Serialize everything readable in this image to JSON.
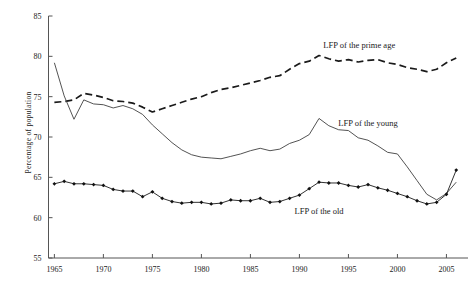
{
  "chart_data": {
    "type": "line",
    "title": "",
    "xlabel": "",
    "ylabel": "Percentage of population",
    "xlim": [
      1964.4,
      2007.2
    ],
    "ylim": [
      55,
      85
    ],
    "grid": false,
    "legend_position": "inline-annotations",
    "x_ticks": [
      "1965",
      "1970",
      "1975",
      "1980",
      "1985",
      "1990",
      "1995",
      "2000",
      "2005"
    ],
    "x_tick_values": [
      1965,
      1970,
      1975,
      1980,
      1985,
      1990,
      1995,
      2000,
      2005
    ],
    "y_ticks": [
      "55",
      "60",
      "65",
      "70",
      "75",
      "80",
      "85"
    ],
    "y_tick_values": [
      55,
      60,
      65,
      70,
      75,
      80,
      85
    ],
    "x": [
      1965,
      1966,
      1967,
      1968,
      1969,
      1970,
      1971,
      1972,
      1973,
      1974,
      1975,
      1976,
      1977,
      1978,
      1979,
      1980,
      1981,
      1982,
      1983,
      1984,
      1985,
      1986,
      1987,
      1988,
      1989,
      1990,
      1991,
      1992,
      1993,
      1994,
      1995,
      1996,
      1997,
      1998,
      1999,
      2000,
      2001,
      2002,
      2003,
      2004,
      2005,
      2006
    ],
    "series": [
      {
        "name": "LFP of the prime age",
        "style": "dashed",
        "marker": "none",
        "color": "#1a1a1a",
        "label": "LFP of the prime age",
        "values": [
          74.3,
          74.4,
          74.6,
          75.4,
          75.2,
          74.9,
          74.5,
          74.4,
          74.2,
          73.7,
          73.1,
          73.5,
          73.9,
          74.3,
          74.7,
          75.0,
          75.5,
          75.9,
          76.1,
          76.4,
          76.7,
          77.0,
          77.4,
          77.6,
          78.4,
          79.1,
          79.4,
          80.1,
          79.7,
          79.4,
          79.6,
          79.3,
          79.5,
          79.6,
          79.2,
          79.0,
          78.6,
          78.4,
          78.1,
          78.4,
          79.2,
          79.8
        ]
      },
      {
        "name": "LFP of the young",
        "style": "solid-thin",
        "marker": "none",
        "color": "#404040",
        "label": "LFP of the young",
        "values": [
          79.2,
          75.1,
          72.2,
          74.6,
          74.1,
          74.0,
          73.6,
          73.9,
          73.5,
          72.8,
          71.5,
          70.4,
          69.3,
          68.4,
          67.8,
          67.5,
          67.4,
          67.3,
          67.6,
          67.9,
          68.3,
          68.6,
          68.3,
          68.5,
          69.2,
          69.6,
          70.3,
          72.3,
          71.4,
          70.9,
          70.8,
          69.9,
          69.6,
          68.9,
          68.1,
          67.9,
          66.3,
          64.6,
          62.9,
          62.2,
          63.0,
          64.4
        ]
      },
      {
        "name": "LFP of the old",
        "style": "solid-marker",
        "marker": "diamond",
        "color": "#111111",
        "label": "LFP of the old",
        "values": [
          64.2,
          64.5,
          64.2,
          64.2,
          64.1,
          64.0,
          63.5,
          63.3,
          63.3,
          62.6,
          63.2,
          62.4,
          62.0,
          61.8,
          61.9,
          61.9,
          61.7,
          61.8,
          62.2,
          62.1,
          62.1,
          62.4,
          61.9,
          62.0,
          62.4,
          62.8,
          63.6,
          64.4,
          64.3,
          64.3,
          64.0,
          63.8,
          64.1,
          63.7,
          63.4,
          63.0,
          62.6,
          62.1,
          61.7,
          61.9,
          62.9,
          65.9
        ]
      }
    ],
    "annotations": [
      {
        "text": "LFP of the prime age",
        "x": 1996.1,
        "y": 81.0
      },
      {
        "text": "LFP of the young",
        "x": 1997.0,
        "y": 71.4
      },
      {
        "text": "LFP of the old",
        "x": 1992.0,
        "y": 60.4
      }
    ]
  }
}
